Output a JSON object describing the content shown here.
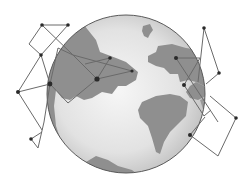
{
  "illustration": {
    "subject": "globe with network connections",
    "colors": {
      "background": "#ffffff",
      "ocean_light": "#f0f0f0",
      "ocean_dark": "#b9b9b9",
      "land": "#8f8f8f",
      "outline": "#5a5a5a",
      "line": "#6a6a6a",
      "node": "#2a2a2a"
    },
    "globe": {
      "cx": 126,
      "cy": 94,
      "r": 79
    },
    "nodes": [
      {
        "id": "A",
        "x": 42,
        "y": 25,
        "r": 1.8
      },
      {
        "id": "B",
        "x": 68,
        "y": 25,
        "r": 1.8
      },
      {
        "id": "D",
        "x": 41,
        "y": 55,
        "r": 1.8
      },
      {
        "id": "E",
        "x": 18,
        "y": 92,
        "r": 2
      },
      {
        "id": "F",
        "x": 50,
        "y": 84,
        "r": 2.4
      },
      {
        "id": "G",
        "x": 97,
        "y": 79,
        "r": 2.6
      },
      {
        "id": "H",
        "x": 110,
        "y": 58,
        "r": 1.8
      },
      {
        "id": "I",
        "x": 132,
        "y": 71,
        "r": 1.6
      },
      {
        "id": "J",
        "x": 204,
        "y": 28,
        "r": 1.8
      },
      {
        "id": "K",
        "x": 219,
        "y": 73,
        "r": 1.8
      },
      {
        "id": "L",
        "x": 176,
        "y": 58,
        "r": 2
      },
      {
        "id": "M",
        "x": 184,
        "y": 85,
        "r": 2
      },
      {
        "id": "N",
        "x": 190,
        "y": 135,
        "r": 2
      },
      {
        "id": "O",
        "x": 236,
        "y": 118,
        "r": 1.8
      },
      {
        "id": "Q",
        "x": 31,
        "y": 139,
        "r": 1.8
      }
    ],
    "edges": [
      [
        [
          42,
          25
        ],
        [
          68,
          25
        ]
      ],
      [
        [
          42,
          25
        ],
        [
          29,
          44
        ]
      ],
      [
        [
          29,
          44
        ],
        [
          41,
          55
        ]
      ],
      [
        [
          41,
          55
        ],
        [
          68,
          25
        ]
      ],
      [
        [
          42,
          25
        ],
        [
          73,
          55
        ]
      ],
      [
        [
          73,
          55
        ],
        [
          97,
          79
        ]
      ],
      [
        [
          41,
          55
        ],
        [
          50,
          84
        ]
      ],
      [
        [
          41,
          55
        ],
        [
          18,
          92
        ]
      ],
      [
        [
          18,
          92
        ],
        [
          50,
          84
        ]
      ],
      [
        [
          50,
          84
        ],
        [
          68,
          103
        ]
      ],
      [
        [
          68,
          103
        ],
        [
          97,
          79
        ]
      ],
      [
        [
          58,
          48
        ],
        [
          73,
          55
        ]
      ],
      [
        [
          58,
          48
        ],
        [
          45,
          70
        ]
      ],
      [
        [
          73,
          55
        ],
        [
          110,
          58
        ]
      ],
      [
        [
          97,
          79
        ],
        [
          110,
          58
        ]
      ],
      [
        [
          80,
          65
        ],
        [
          132,
          71
        ]
      ],
      [
        [
          97,
          79
        ],
        [
          132,
          71
        ]
      ],
      [
        [
          50,
          84
        ],
        [
          44,
          120
        ]
      ],
      [
        [
          44,
          120
        ],
        [
          38,
          148
        ]
      ],
      [
        [
          38,
          148
        ],
        [
          31,
          139
        ]
      ],
      [
        [
          31,
          139
        ],
        [
          42,
          132
        ]
      ],
      [
        [
          18,
          92
        ],
        [
          42,
          130
        ]
      ],
      [
        [
          204,
          28
        ],
        [
          197,
          82
        ]
      ],
      [
        [
          204,
          28
        ],
        [
          219,
          73
        ]
      ],
      [
        [
          219,
          73
        ],
        [
          205,
          84
        ]
      ],
      [
        [
          176,
          58
        ],
        [
          200,
          58
        ]
      ],
      [
        [
          176,
          58
        ],
        [
          217,
          121
        ]
      ],
      [
        [
          200,
          58
        ],
        [
          184,
          85
        ]
      ],
      [
        [
          184,
          85
        ],
        [
          203,
          118
        ]
      ],
      [
        [
          203,
          118
        ],
        [
          217,
          121
        ]
      ],
      [
        [
          190,
          135
        ],
        [
          203,
          118
        ]
      ],
      [
        [
          190,
          135
        ],
        [
          218,
          155
        ]
      ],
      [
        [
          218,
          155
        ],
        [
          236,
          118
        ]
      ],
      [
        [
          236,
          118
        ],
        [
          211,
          96
        ]
      ]
    ]
  }
}
